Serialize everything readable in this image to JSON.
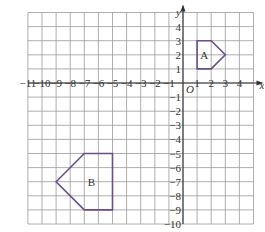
{
  "diagram": {
    "type": "coordinate-grid",
    "x_axis": {
      "label": "x",
      "min": -11,
      "max": 5,
      "tick_labels": [
        "-11",
        "-10",
        "-9",
        "-8",
        "-7",
        "-6",
        "-5",
        "-4",
        "-3",
        "-2",
        "-1",
        "1",
        "2",
        "3",
        "4"
      ],
      "tick_values": [
        -11,
        -10,
        -9,
        -8,
        -7,
        -6,
        -5,
        -4,
        -3,
        -2,
        -1,
        1,
        2,
        3,
        4
      ]
    },
    "y_axis": {
      "label": "y",
      "min": -10,
      "max": 5,
      "tick_labels": [
        "4",
        "3",
        "2",
        "1",
        "-1",
        "-2",
        "-3",
        "-4",
        "-5",
        "-6",
        "-7",
        "-8",
        "-9",
        "-10"
      ],
      "tick_values": [
        4,
        3,
        2,
        1,
        -1,
        -2,
        -3,
        -4,
        -5,
        -6,
        -7,
        -8,
        -9,
        -10
      ]
    },
    "origin_label": "O",
    "shapes": [
      {
        "label": "A",
        "vertices": [
          [
            1,
            1
          ],
          [
            1,
            3
          ],
          [
            2,
            3
          ],
          [
            3,
            2
          ],
          [
            2,
            1
          ]
        ],
        "label_pos": [
          1.5,
          2
        ],
        "stroke": "#6b4f8a"
      },
      {
        "label": "B",
        "vertices": [
          [
            -9,
            -7
          ],
          [
            -7,
            -5
          ],
          [
            -5,
            -5
          ],
          [
            -5,
            -9
          ],
          [
            -7,
            -9
          ]
        ],
        "label_pos": [
          -6.5,
          -7
        ],
        "stroke": "#6b4f8a"
      }
    ],
    "colors": {
      "grid": "#9a9a9a",
      "axis": "#333333",
      "shape_stroke": "#6b4f8a",
      "text": "#333333"
    }
  }
}
